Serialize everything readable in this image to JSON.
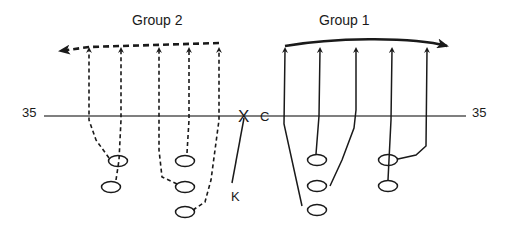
{
  "diagram": {
    "type": "football-kickoff-play",
    "groups": [
      {
        "id": "group-2",
        "label": "Group 2",
        "line_style": "dashed",
        "direction": "left",
        "players": 5
      },
      {
        "id": "group-1",
        "label": "Group 1",
        "line_style": "solid",
        "direction": "right",
        "players": 5
      }
    ],
    "yard_line": {
      "left_label": "35",
      "right_label": "35"
    },
    "markers": {
      "x": "X",
      "center": "C",
      "kicker": "K"
    }
  },
  "colors": {
    "line": "#1a1a1a",
    "background": "#ffffff",
    "yard_line": "#555555"
  }
}
